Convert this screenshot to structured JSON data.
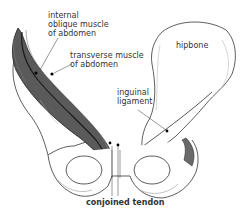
{
  "diagram": {
    "labels": {
      "internal_oblique": "internal\noblique muscle\nof abdomen",
      "transverse": "transverse muscle\nof abdomen",
      "hipbone": "hipbone",
      "inguinal": "inguinal\nligament",
      "conjoined": "conjoined tendon"
    },
    "colors": {
      "line": "#333333",
      "muscle_dark": "#3a3a3a",
      "muscle_mid": "#6a6a6a",
      "bone_fill": "#ffffff",
      "shade": "#9a9a9a"
    }
  }
}
